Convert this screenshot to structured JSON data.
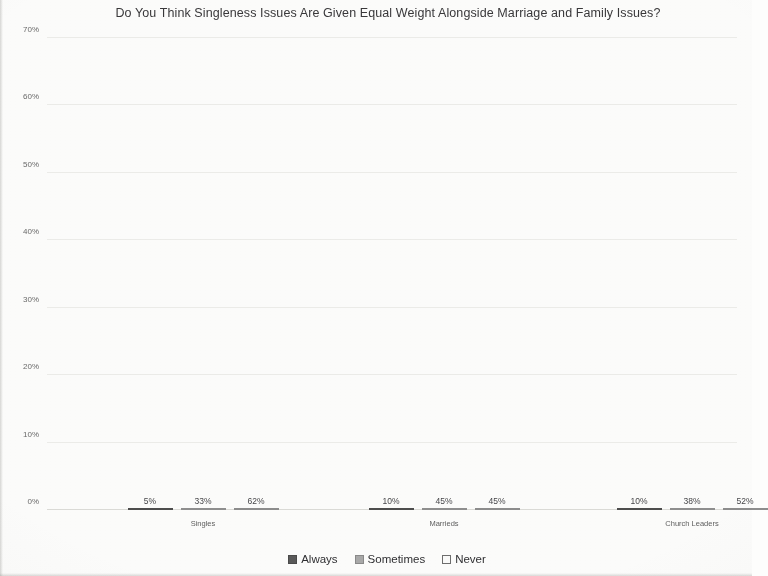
{
  "chart_data": {
    "type": "bar",
    "title": "Do You Think Singleness Issues Are Given Equal Weight Alongside Marriage and Family Issues?",
    "xlabel": "",
    "ylabel": "",
    "ylim": [
      0,
      70
    ],
    "ytick_labels": [
      "70%",
      "60%",
      "50%",
      "40%",
      "30%",
      "20%",
      "10%",
      "0%"
    ],
    "ytick_values": [
      70,
      60,
      50,
      40,
      30,
      20,
      10,
      0
    ],
    "grid": true,
    "legend_position": "bottom",
    "categories": [
      "Singles",
      "Marrieds",
      "Church Leaders"
    ],
    "series": [
      {
        "name": "Always",
        "color": "#5a5a5a",
        "values": [
          5,
          10,
          10
        ],
        "value_labels": [
          "5%",
          "10%",
          "10%"
        ]
      },
      {
        "name": "Sometimes",
        "color": "#a9a9a9",
        "values": [
          33,
          45,
          38
        ],
        "value_labels": [
          "33%",
          "45%",
          "38%"
        ]
      },
      {
        "name": "Never",
        "color": "#ededec",
        "values": [
          62,
          45,
          52
        ],
        "value_labels": [
          "62%",
          "45%",
          "52%"
        ]
      }
    ]
  }
}
